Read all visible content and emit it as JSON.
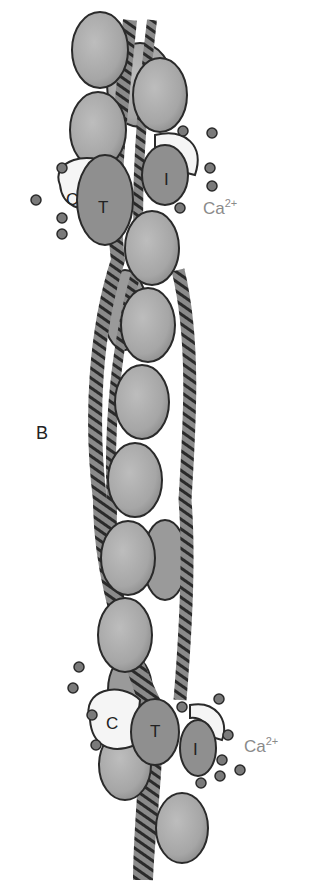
{
  "figure": {
    "panel_label": "B",
    "top_complex": {
      "tnC": "C",
      "tnT": "T",
      "tnI": "I",
      "ion": "Ca",
      "charge": "2+"
    },
    "bottom_complex": {
      "tnC": "C",
      "tnT": "T",
      "tnI": "I",
      "ion": "Ca",
      "charge": "2+"
    }
  },
  "colors": {
    "actin": "#a9a9a9",
    "troponin": "#8f8f8f",
    "outline": "#2a2a2a",
    "calcium": "#7a7a7a",
    "label_ca": "#8a8a8a"
  }
}
